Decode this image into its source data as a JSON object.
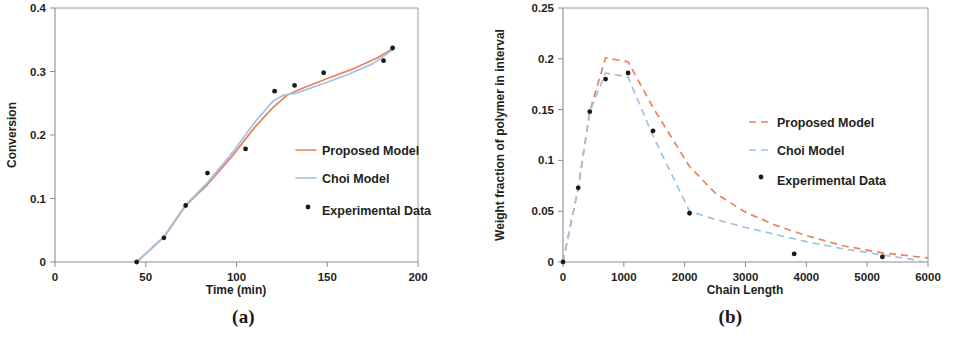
{
  "figure": {
    "panels": [
      {
        "caption": "(a)",
        "name": "conversion-vs-time"
      },
      {
        "caption": "(b)",
        "name": "weight-fraction-vs-chain-length"
      }
    ],
    "colors": {
      "proposed_model": "#E8825C",
      "choi_model": "#9DC3E6",
      "experimental_data": "#1a1a1a",
      "axis": "#8d8d8d",
      "frame": "#9a9a9a"
    }
  },
  "chart_data": [
    {
      "type": "line",
      "panel": "(a)",
      "title": "",
      "xlabel": "Time (min)",
      "ylabel": "Conversion",
      "xlim": [
        0,
        200
      ],
      "ylim": [
        0,
        0.4
      ],
      "xticks": [
        0,
        50,
        100,
        150,
        200
      ],
      "xtick_labels": [
        "0",
        "50",
        "100",
        "150",
        "200"
      ],
      "yticks": [
        0,
        0.1,
        0.2,
        0.3,
        0.4
      ],
      "ytick_labels": [
        "0",
        "0.1",
        "0.2",
        "0.3",
        "0.4"
      ],
      "grid": false,
      "legend_position": "center-right",
      "legend": [
        "Proposed Model",
        "Choi Model",
        "Experimental Data"
      ],
      "series": [
        {
          "name": "Proposed Model",
          "style": "solid",
          "color": "#E8825C",
          "x": [
            45,
            60,
            72,
            84,
            98,
            110,
            120,
            128,
            135,
            150,
            165,
            178,
            186
          ],
          "y": [
            0.0,
            0.039,
            0.089,
            0.122,
            0.168,
            0.212,
            0.243,
            0.263,
            0.272,
            0.289,
            0.305,
            0.322,
            0.336
          ]
        },
        {
          "name": "Choi Model",
          "style": "solid",
          "color": "#9DC3E6",
          "x": [
            45,
            60,
            72,
            84,
            98,
            110,
            120,
            126,
            133,
            148,
            162,
            175,
            186
          ],
          "y": [
            0.0,
            0.04,
            0.09,
            0.125,
            0.173,
            0.22,
            0.253,
            0.263,
            0.266,
            0.281,
            0.296,
            0.312,
            0.334
          ]
        },
        {
          "name": "Experimental Data",
          "style": "points",
          "color": "#1a1a1a",
          "x": [
            45,
            60,
            72,
            84,
            105,
            121,
            132,
            148,
            181,
            186
          ],
          "y": [
            0.0,
            0.038,
            0.089,
            0.14,
            0.178,
            0.269,
            0.278,
            0.298,
            0.317,
            0.337
          ]
        }
      ]
    },
    {
      "type": "line",
      "panel": "(b)",
      "title": "",
      "xlabel": "Chain Length",
      "ylabel": "Weight fraction of polymer in interval",
      "xlim": [
        0,
        6000
      ],
      "ylim": [
        0,
        0.25
      ],
      "xticks": [
        0,
        1000,
        2000,
        3000,
        4000,
        5000,
        6000
      ],
      "xtick_labels": [
        "0",
        "1000",
        "2000",
        "3000",
        "4000",
        "5000",
        "6000"
      ],
      "yticks": [
        0,
        0.05,
        0.1,
        0.15,
        0.2,
        0.25
      ],
      "ytick_labels": [
        "0",
        "0.05",
        "0.1",
        "0.15",
        "0.2",
        "0.25"
      ],
      "grid": false,
      "legend_position": "center-right",
      "legend": [
        "Proposed Model",
        "Choi Model",
        "Experimental Data"
      ],
      "series": [
        {
          "name": "Proposed Model",
          "style": "dashed",
          "color": "#E8825C",
          "x": [
            0,
            250,
            440,
            700,
            1070,
            1480,
            2080,
            2500,
            3000,
            3500,
            4000,
            4600,
            5250,
            5700,
            6000
          ],
          "y": [
            0.0,
            0.073,
            0.148,
            0.201,
            0.197,
            0.152,
            0.094,
            0.068,
            0.049,
            0.036,
            0.026,
            0.016,
            0.009,
            0.006,
            0.004
          ]
        },
        {
          "name": "Choi Model",
          "style": "dashed",
          "color": "#9DC3E6",
          "x": [
            0,
            250,
            440,
            700,
            1070,
            1480,
            2080,
            2500,
            3000,
            3500,
            4000,
            4600,
            5250,
            5700,
            6000
          ],
          "y": [
            0.0,
            0.073,
            0.148,
            0.186,
            0.182,
            0.124,
            0.05,
            0.042,
            0.034,
            0.027,
            0.02,
            0.013,
            0.007,
            0.003,
            -0.001
          ]
        },
        {
          "name": "Experimental Data",
          "style": "points",
          "color": "#1a1a1a",
          "x": [
            0,
            250,
            440,
            700,
            1070,
            1480,
            2080,
            3800,
            5250
          ],
          "y": [
            0.0,
            0.073,
            0.148,
            0.18,
            0.186,
            0.129,
            0.048,
            0.008,
            0.005
          ]
        }
      ]
    }
  ]
}
